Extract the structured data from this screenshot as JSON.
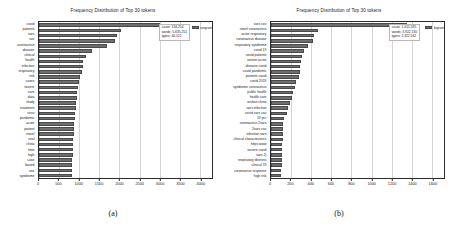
{
  "figure": {
    "bar_color": "#6e6e6e",
    "grid_color": "#d4d4d4",
    "axis_color": "#2b2b2b"
  },
  "panels": [
    {
      "caption": "(a)",
      "title": "Frequency Distribution of Top 30 tokens",
      "legend_label": "unigram",
      "stats": {
        "count_line": "count: 134,250",
        "words_line": "words: 5,635,251",
        "types_line": "types: 40,121"
      },
      "xticks": [
        "0",
        "500",
        "1000",
        "1500",
        "2000",
        "2500",
        "3000",
        "3500",
        "4000"
      ],
      "chart_data": {
        "type": "bar",
        "orientation": "horizontal",
        "title": "Frequency Distribution of Top 30 tokens",
        "xlabel": "",
        "ylabel": "",
        "xlim": [
          0,
          4300
        ],
        "grid": true,
        "legend_position": "upper right",
        "categories": [
          "covid",
          "patients",
          "sars",
          "cov",
          "coronavirus",
          "disease",
          "clinical",
          "health",
          "infection",
          "respiratory",
          "risk",
          "cases",
          "severe",
          "care",
          "data",
          "study",
          "treatment",
          "virus",
          "pandemic",
          "acute",
          "patient",
          "novel",
          "viral",
          "china",
          "time",
          "high",
          "case",
          "based",
          "use",
          "syndrome"
        ],
        "values": [
          3010,
          2050,
          1930,
          1880,
          1680,
          1320,
          1170,
          1090,
          1085,
          1080,
          1010,
          985,
          960,
          950,
          935,
          925,
          915,
          905,
          890,
          880,
          870,
          860,
          850,
          845,
          840,
          835,
          830,
          825,
          820,
          815
        ]
      }
    },
    {
      "caption": "(b)",
      "title": "Frequency Distribution of Top 30 tokens",
      "legend_label": "bigram",
      "stats": {
        "count_line": "count: 1,051,595",
        "words_line": "words: 3,922,130",
        "types_line": "types: 2,322,562"
      },
      "xticks": [
        "0",
        "200",
        "400",
        "600",
        "800",
        "1000",
        "1200",
        "1400",
        "1600"
      ],
      "chart_data": {
        "type": "bar",
        "orientation": "horizontal",
        "title": "Frequency Distribution of Top 30 tokens",
        "xlabel": "",
        "ylabel": "",
        "xlim": [
          0,
          1720
        ],
        "grid": true,
        "legend_position": "upper right",
        "categories": [
          "sars cov",
          "novel coronavirus",
          "acute respiratory",
          "coronavirus disease",
          "respiratory syndrome",
          "covid 19",
          "covid patients",
          "severe acute",
          "disease covid",
          "covid pandemic",
          "patients covid",
          "covid 2019",
          "syndrome coronavirus",
          "public health",
          "health care",
          "wuhan china",
          "sars infection",
          "covid sars cov",
          "19 pcr",
          "coronavirus 2sars",
          "2sars cov",
          "infection sars",
          "clinical characteristics",
          "https www",
          "severe covid",
          "sars 2)",
          "respiratory distress",
          "clinical 19",
          "coronavirus response",
          "high risk"
        ],
        "values": [
          1350,
          470,
          425,
          420,
          370,
          330,
          305,
          300,
          290,
          285,
          280,
          250,
          235,
          215,
          210,
          185,
          165,
          160,
          125,
          122,
          120,
          118,
          116,
          114,
          112,
          110,
          108,
          106,
          104,
          95
        ]
      }
    }
  ]
}
